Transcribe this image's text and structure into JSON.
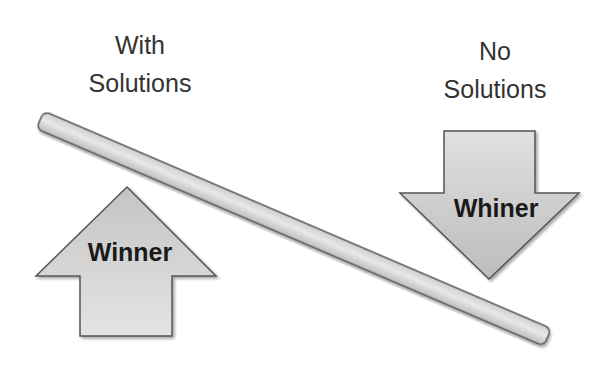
{
  "diagram": {
    "left_label": {
      "line1": "With",
      "line2": "Solutions"
    },
    "right_label": {
      "line1": "No",
      "line2": "Solutions"
    },
    "up_arrow": {
      "label": "Winner",
      "direction": "up"
    },
    "down_arrow": {
      "label": "Whiner",
      "direction": "down"
    },
    "seesaw_bar": {
      "orientation": "tilted down to the right"
    }
  },
  "colors": {
    "shape_fill_light": "#e6e6e6",
    "shape_fill_dark": "#b8b8b8",
    "shape_stroke": "#555555",
    "text": "#333333",
    "background": "#ffffff"
  }
}
